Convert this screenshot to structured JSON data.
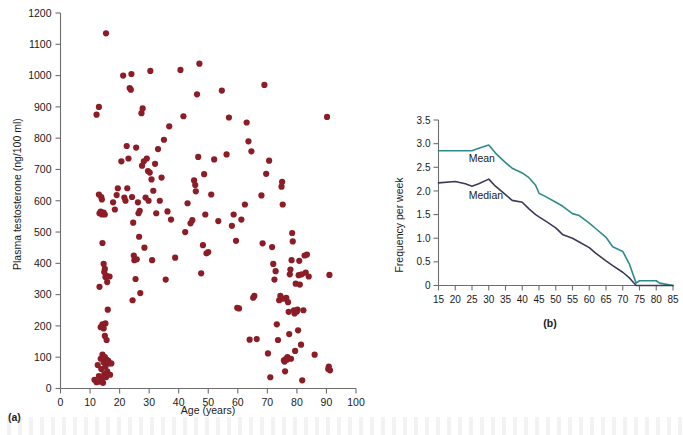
{
  "figure": {
    "panel_a_tag": "(a)",
    "panel_b_tag": "(b)",
    "dot_color": "#8c1d26",
    "mean_color": "#2e8b8b",
    "median_color": "#3b3a5c",
    "axis_color": "#6e6e6e"
  },
  "chart_data": [
    {
      "type": "scatter",
      "panel": "(a)",
      "title": "",
      "xlabel": "Age (years)",
      "ylabel": "Plasma testosterone (ng/100 ml)",
      "xlim": [
        0,
        100
      ],
      "ylim": [
        0,
        1200
      ],
      "xticks": [
        0,
        10,
        20,
        30,
        40,
        50,
        60,
        70,
        80,
        90,
        100
      ],
      "yticks": [
        0,
        100,
        200,
        300,
        400,
        500,
        600,
        700,
        800,
        900,
        1000,
        1100,
        1200
      ],
      "grid": false,
      "legend": "none",
      "series": [
        {
          "name": "Plasma testosterone",
          "color": "#8c1d26",
          "points": [
            [
              11.5,
              28
            ],
            [
              12.2,
              20
            ],
            [
              12.6,
              75
            ],
            [
              13.0,
              40
            ],
            [
              13.4,
              22
            ],
            [
              13.6,
              95
            ],
            [
              13.8,
              62
            ],
            [
              14.0,
              30
            ],
            [
              14.2,
              108
            ],
            [
              14.4,
              18
            ],
            [
              14.6,
              84
            ],
            [
              14.8,
              46
            ],
            [
              15.0,
              100
            ],
            [
              15.2,
              70
            ],
            [
              15.4,
              36
            ],
            [
              15.6,
              92
            ],
            [
              15.8,
              55
            ],
            [
              16.0,
              82
            ],
            [
              16.2,
              88
            ],
            [
              16.4,
              80
            ],
            [
              16.8,
              44
            ],
            [
              17.2,
              80
            ],
            [
              13.6,
              196
            ],
            [
              14.2,
              205
            ],
            [
              14.6,
              192
            ],
            [
              15.2,
              208
            ],
            [
              15.0,
              168
            ],
            [
              15.6,
              155
            ],
            [
              16.0,
              252
            ],
            [
              13.2,
              325
            ],
            [
              14.6,
              398
            ],
            [
              14.8,
              372
            ],
            [
              15.0,
              382
            ],
            [
              15.2,
              356
            ],
            [
              15.6,
              360
            ],
            [
              15.8,
              340
            ],
            [
              16.6,
              358
            ],
            [
              14.2,
              465
            ],
            [
              13.2,
              560
            ],
            [
              13.6,
              565
            ],
            [
              14.0,
              556
            ],
            [
              14.6,
              562
            ],
            [
              15.0,
              556
            ],
            [
              13.0,
              620
            ],
            [
              13.8,
              612
            ],
            [
              14.0,
              604
            ],
            [
              12.2,
              875
            ],
            [
              13.0,
              900
            ],
            [
              15.4,
              1135
            ],
            [
              17.8,
              595
            ],
            [
              18.4,
              572
            ],
            [
              19.0,
              618
            ],
            [
              19.4,
              640
            ],
            [
              20.6,
              726
            ],
            [
              21.2,
              1000
            ],
            [
              21.6,
              610
            ],
            [
              22.0,
              600
            ],
            [
              22.4,
              775
            ],
            [
              22.6,
              640
            ],
            [
              23.0,
              735
            ],
            [
              23.4,
              960
            ],
            [
              23.8,
              955
            ],
            [
              24.0,
              1005
            ],
            [
              24.2,
              612
            ],
            [
              24.4,
              282
            ],
            [
              24.6,
              530
            ],
            [
              24.8,
              425
            ],
            [
              25.0,
              410
            ],
            [
              25.4,
              350
            ],
            [
              25.6,
              770
            ],
            [
              25.8,
              413
            ],
            [
              26.2,
              595
            ],
            [
              26.4,
              560
            ],
            [
              26.6,
              485
            ],
            [
              26.8,
              568
            ],
            [
              27.0,
              305
            ],
            [
              27.4,
              880
            ],
            [
              27.6,
              712
            ],
            [
              27.8,
              895
            ],
            [
              28.2,
              726
            ],
            [
              28.4,
              450
            ],
            [
              28.8,
              610
            ],
            [
              29.2,
              735
            ],
            [
              29.6,
              695
            ],
            [
              29.8,
              600
            ],
            [
              30.2,
              690
            ],
            [
              30.4,
              1015
            ],
            [
              30.8,
              668
            ],
            [
              31.0,
              410
            ],
            [
              31.4,
              632
            ],
            [
              32.0,
              718
            ],
            [
              32.4,
              560
            ],
            [
              33.0,
              765
            ],
            [
              33.6,
              600
            ],
            [
              34.2,
              674
            ],
            [
              35.0,
              795
            ],
            [
              35.6,
              348
            ],
            [
              36.2,
              566
            ],
            [
              36.8,
              838
            ],
            [
              37.4,
              540
            ],
            [
              38.8,
              418
            ],
            [
              40.6,
              1018
            ],
            [
              41.6,
              870
            ],
            [
              42.2,
              500
            ],
            [
              43.0,
              592
            ],
            [
              44.0,
              528
            ],
            [
              44.6,
              538
            ],
            [
              45.2,
              665
            ],
            [
              45.6,
              650
            ],
            [
              45.8,
              630
            ],
            [
              46.2,
              940
            ],
            [
              46.6,
              740
            ],
            [
              47.0,
              1038
            ],
            [
              47.6,
              368
            ],
            [
              48.2,
              458
            ],
            [
              48.6,
              685
            ],
            [
              49.0,
              556
            ],
            [
              49.4,
              432
            ],
            [
              50.0,
              436
            ],
            [
              51.0,
              620
            ],
            [
              52.0,
              732
            ],
            [
              53.4,
              535
            ],
            [
              54.6,
              952
            ],
            [
              56.2,
              748
            ],
            [
              57.0,
              866
            ],
            [
              58.0,
              520
            ],
            [
              58.6,
              556
            ],
            [
              59.4,
              472
            ],
            [
              59.8,
              258
            ],
            [
              60.4,
              256
            ],
            [
              61.2,
              540
            ],
            [
              62.4,
              588
            ],
            [
              63.0,
              850
            ],
            [
              63.6,
              790
            ],
            [
              64.0,
              156
            ],
            [
              64.6,
              758
            ],
            [
              65.2,
              290
            ],
            [
              65.6,
              296
            ],
            [
              66.4,
              158
            ],
            [
              68.0,
              617
            ],
            [
              68.4,
              464
            ],
            [
              69.0,
              970
            ],
            [
              69.6,
              686
            ],
            [
              70.2,
              112
            ],
            [
              70.6,
              728
            ],
            [
              71.0,
              36
            ],
            [
              71.6,
              452
            ],
            [
              72.0,
              398
            ],
            [
              72.4,
              348
            ],
            [
              72.8,
              375
            ],
            [
              73.2,
              205
            ],
            [
              73.6,
              155
            ],
            [
              74.0,
              282
            ],
            [
              74.4,
              296
            ],
            [
              74.8,
              645
            ],
            [
              75.0,
              660
            ],
            [
              75.2,
              588
            ],
            [
              75.4,
              287
            ],
            [
              75.6,
              90
            ],
            [
              75.8,
              86
            ],
            [
              76.0,
              55
            ],
            [
              76.2,
              94
            ],
            [
              76.4,
              290
            ],
            [
              76.6,
              92
            ],
            [
              76.8,
              100
            ],
            [
              77.0,
              276
            ],
            [
              77.2,
              245
            ],
            [
              77.4,
              174
            ],
            [
              77.6,
              365
            ],
            [
              77.8,
              380
            ],
            [
              78.0,
              95
            ],
            [
              78.2,
              410
            ],
            [
              78.4,
              497
            ],
            [
              78.6,
              470
            ],
            [
              79.0,
              250
            ],
            [
              79.2,
              240
            ],
            [
              79.4,
              120
            ],
            [
              79.6,
              335
            ],
            [
              79.8,
              248
            ],
            [
              80.0,
              246
            ],
            [
              80.2,
              252
            ],
            [
              80.4,
              186
            ],
            [
              80.6,
              362
            ],
            [
              80.8,
              408
            ],
            [
              81.0,
              332
            ],
            [
              81.4,
              140
            ],
            [
              81.6,
              365
            ],
            [
              81.8,
              26
            ],
            [
              82.2,
              250
            ],
            [
              82.6,
              425
            ],
            [
              83.0,
              370
            ],
            [
              83.4,
              428
            ],
            [
              84.0,
              358
            ],
            [
              86.0,
              108
            ],
            [
              90.2,
              868
            ],
            [
              90.6,
              62
            ],
            [
              90.8,
              70
            ],
            [
              91.0,
              363
            ],
            [
              91.2,
              58
            ]
          ]
        }
      ]
    },
    {
      "type": "line",
      "panel": "(b)",
      "title": "",
      "xlabel": "",
      "ylabel": "Frequency per week",
      "xlim": [
        15,
        85
      ],
      "ylim": [
        0,
        3.5
      ],
      "xticks": [
        15,
        20,
        25,
        30,
        35,
        40,
        45,
        50,
        55,
        60,
        65,
        70,
        75,
        80,
        85
      ],
      "yticks": [
        0,
        0.5,
        1.0,
        1.5,
        2.0,
        2.5,
        3.0,
        3.5
      ],
      "ytick_labels": [
        "0",
        "0.5",
        "1.0",
        "1.5",
        "2.0",
        "2.5",
        "3.0",
        "3.5"
      ],
      "grid": false,
      "legend": "inline-labels",
      "series": [
        {
          "name": "Mean",
          "color": "#2e8b8b",
          "x": [
            15,
            20,
            25,
            27,
            30,
            32,
            35,
            37,
            40,
            42,
            44,
            45,
            47,
            50,
            52,
            55,
            57,
            60,
            62,
            65,
            67,
            70,
            72,
            74,
            75,
            80,
            81,
            85
          ],
          "y": [
            2.85,
            2.85,
            2.85,
            2.9,
            2.97,
            2.8,
            2.6,
            2.48,
            2.38,
            2.28,
            2.12,
            1.95,
            1.88,
            1.76,
            1.68,
            1.52,
            1.48,
            1.32,
            1.2,
            1.02,
            0.82,
            0.72,
            0.45,
            0.05,
            0.1,
            0.1,
            0.05,
            0.0
          ]
        },
        {
          "name": "Median",
          "color": "#3b3a5c",
          "x": [
            15,
            20,
            23,
            25,
            27,
            30,
            32,
            35,
            37,
            40,
            42,
            44,
            45,
            47,
            50,
            52,
            55,
            57,
            60,
            62,
            65,
            67,
            70,
            72,
            74,
            85
          ],
          "y": [
            2.17,
            2.2,
            2.15,
            2.1,
            2.15,
            2.25,
            2.1,
            1.92,
            1.8,
            1.76,
            1.62,
            1.5,
            1.45,
            1.36,
            1.22,
            1.08,
            1.0,
            0.92,
            0.8,
            0.68,
            0.52,
            0.42,
            0.28,
            0.16,
            0.0,
            0.0
          ]
        }
      ],
      "annotations": [
        {
          "text": "Mean",
          "x": 24,
          "y": 2.62
        },
        {
          "text": "Median",
          "x": 24,
          "y": 1.82
        }
      ]
    }
  ]
}
